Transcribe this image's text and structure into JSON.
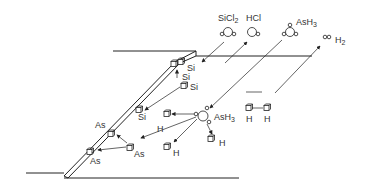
{
  "diagram": {
    "type": "surface-reaction-schematic",
    "gas_species": [
      {
        "id": "sicl2",
        "label": "SiCl",
        "sub": "2"
      },
      {
        "id": "hcl",
        "label": "HCl",
        "sub": ""
      },
      {
        "id": "ash3_gas",
        "label": "AsH",
        "sub": "3"
      },
      {
        "id": "h2",
        "label": "H",
        "sub": "2"
      }
    ],
    "surface_labels": {
      "si_step_1": "Si",
      "si_step_2": "Si",
      "si_adatom": "Si",
      "si_edge": "Si",
      "as_edge_top": "As",
      "as_adatom": "As",
      "as_edge_bottom": "As",
      "h_left": "H",
      "h_bottom": "H",
      "h_right": "H",
      "h_pair_1": "H",
      "h_pair_2": "H"
    },
    "adsorbed": {
      "label": "AsH",
      "sub": "3"
    },
    "colors": {
      "line": "#222222",
      "text": "#333333",
      "background": "#ffffff"
    }
  }
}
